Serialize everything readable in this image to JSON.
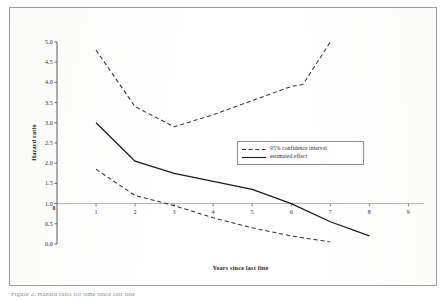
{
  "figure": {
    "caption_fragment": "Figure 2. Hazard ratio for time since last fine"
  },
  "chart_data": {
    "type": "line",
    "title": "",
    "xlabel": "Years since last fine",
    "ylabel": "Hazard ratio",
    "xlim": [
      0,
      9.4
    ],
    "ylim": [
      0.0,
      5.0
    ],
    "grid": false,
    "legend_position": "upper-right",
    "reference_line": {
      "y": 1.0,
      "label": "1.0"
    },
    "x_ticks": [
      "1",
      "2",
      "3",
      "4",
      "5",
      "6",
      "7",
      "8",
      "9"
    ],
    "x_tick_values": [
      1,
      2,
      3,
      4,
      5,
      6,
      7,
      8,
      9
    ],
    "y_ticks": [
      "0.0",
      "0.5",
      "1.0",
      "1.5",
      "2.0",
      "2.5",
      "3.0",
      "3.5",
      "4.0",
      "4.5",
      "5.0"
    ],
    "y_tick_values": [
      0.0,
      0.5,
      1.0,
      1.5,
      2.0,
      2.5,
      3.0,
      3.5,
      4.0,
      4.5,
      5.0
    ],
    "series": [
      {
        "name": "95% confidence interval",
        "role": "upper-bound",
        "style": "dashed",
        "color": "#333333",
        "x": [
          1,
          2,
          3,
          4,
          5,
          6,
          6.3,
          7
        ],
        "values": [
          4.8,
          3.4,
          2.9,
          3.2,
          3.55,
          3.9,
          3.95,
          5.0
        ]
      },
      {
        "name": "estimated effect",
        "role": "point-estimate",
        "style": "solid",
        "color": "#1a1a1a",
        "x": [
          1,
          2,
          3,
          4,
          5,
          6,
          7,
          8
        ],
        "values": [
          3.0,
          2.05,
          1.75,
          1.55,
          1.35,
          1.0,
          0.55,
          0.2
        ]
      },
      {
        "name": "95% confidence interval",
        "role": "lower-bound",
        "style": "dashed",
        "color": "#333333",
        "x": [
          1,
          2,
          3,
          4,
          5,
          6,
          7
        ],
        "values": [
          1.85,
          1.2,
          0.95,
          0.65,
          0.4,
          0.2,
          0.05
        ]
      }
    ],
    "legend": [
      {
        "label": "95% confidence interval",
        "style": "dashed"
      },
      {
        "label": "estimated effect",
        "style": "solid"
      }
    ]
  }
}
